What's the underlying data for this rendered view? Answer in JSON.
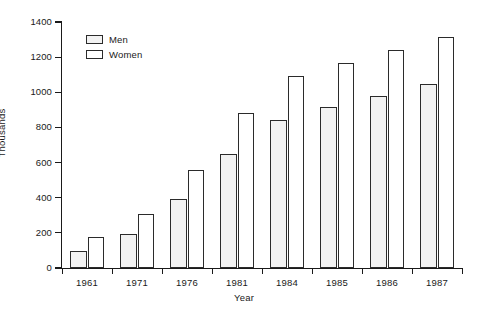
{
  "chart_data": {
    "type": "bar",
    "title": "",
    "xlabel": "Year",
    "ylabel": "Thousands",
    "categories": [
      "1961",
      "1971",
      "1976",
      "1981",
      "1984",
      "1985",
      "1986",
      "1987"
    ],
    "series": [
      {
        "name": "Men",
        "values": [
          95,
          195,
          395,
          650,
          840,
          915,
          980,
          1045
        ]
      },
      {
        "name": "Women",
        "values": [
          175,
          310,
          560,
          885,
          1090,
          1165,
          1240,
          1315
        ]
      }
    ],
    "ylim": [
      0,
      1400
    ],
    "ytick_labels": [
      "0",
      "200",
      "400",
      "600",
      "800",
      "1000",
      "1200",
      "1400"
    ],
    "ytick_values": [
      0,
      200,
      400,
      600,
      800,
      1000,
      1200,
      1400
    ],
    "grid": false,
    "legend_position": "top-left",
    "colors": {
      "men_fill": "#f2f2f2",
      "men_pattern": "#8f8f8f",
      "women_fill": "#ffffff",
      "outline": "#2b2b2b",
      "axis": "#1a1a1a",
      "background": "#ffffff"
    }
  },
  "legend": {
    "items": [
      {
        "label": "Men"
      },
      {
        "label": "Women"
      }
    ]
  },
  "axes": {
    "x_title": "Year",
    "y_title": "Thousands"
  }
}
